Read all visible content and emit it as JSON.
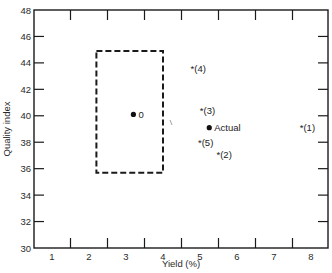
{
  "chart_data": {
    "type": "scatter",
    "title": "",
    "xlabel": "Yield (%)",
    "ylabel": "Quality index",
    "xlim": [
      0.5,
      8.45
    ],
    "ylim": [
      30,
      48
    ],
    "x_tick_labels": [
      "1",
      "2",
      "3",
      "4",
      "5",
      "6",
      "7",
      "8"
    ],
    "x_tick_marks": [
      1.5,
      2.5,
      3.5,
      4.5,
      5.5,
      6.5,
      7.5
    ],
    "y_ticks": [
      30,
      32,
      34,
      36,
      38,
      40,
      42,
      44,
      46,
      48
    ],
    "grid": false,
    "legend": null,
    "series": [
      {
        "name": "Target",
        "marker": "dot",
        "points": [
          {
            "label": "0",
            "x": 3.2,
            "y": 40.1
          }
        ]
      },
      {
        "name": "Actual",
        "marker": "dot",
        "points": [
          {
            "label": "Actual",
            "x": 5.25,
            "y": 39.1
          }
        ]
      },
      {
        "name": "Alternatives",
        "marker": "asterisk",
        "points": [
          {
            "label": "(1)",
            "x": 7.75,
            "y": 39.1
          },
          {
            "label": "(2)",
            "x": 5.5,
            "y": 37.1
          },
          {
            "label": "(3)",
            "x": 5.05,
            "y": 40.4
          },
          {
            "label": "(4)",
            "x": 4.8,
            "y": 43.6
          },
          {
            "label": "(5)",
            "x": 5.0,
            "y": 38.0
          }
        ]
      }
    ],
    "annotations": [
      {
        "type": "dashed-rectangle",
        "x0": 2.2,
        "x1": 4.0,
        "y0": 35.7,
        "y1": 44.9
      }
    ]
  }
}
